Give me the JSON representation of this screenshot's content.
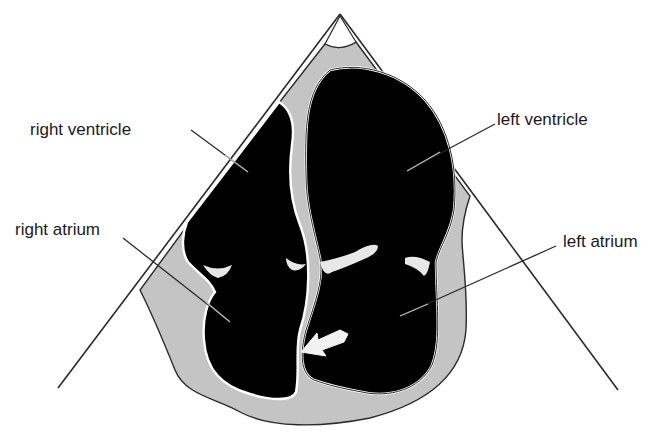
{
  "diagram": {
    "type": "apical four-chamber echocardiogram schematic",
    "colors": {
      "background": "#ffffff",
      "tissue": "#c4c4c4",
      "chamber": "#000000",
      "outline": "#2a2a2a",
      "valve": "#e8e8e8",
      "arrow": "#f2f2f2"
    },
    "labels": [
      {
        "id": "right_ventricle",
        "text": "right ventricle"
      },
      {
        "id": "left_ventricle",
        "text": "left ventricle"
      },
      {
        "id": "right_atrium",
        "text": "right atrium"
      },
      {
        "id": "left_atrium",
        "text": "left atrium"
      }
    ],
    "annotations": {
      "arrow": "white arrow pointing to interatrial septum"
    }
  }
}
